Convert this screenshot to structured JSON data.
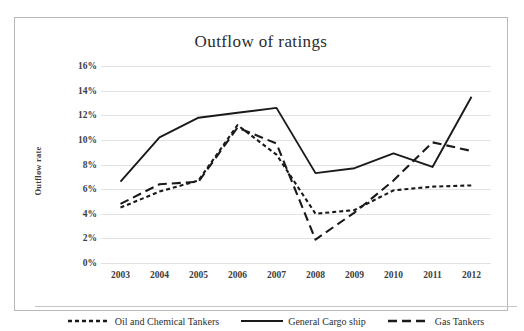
{
  "chart_data": {
    "type": "line",
    "title": "Outflow of ratings",
    "xlabel": "",
    "ylabel": "Outflow rate",
    "x": [
      "2003",
      "2004",
      "2005",
      "2006",
      "2007",
      "2008",
      "2009",
      "2010",
      "2011",
      "2012"
    ],
    "categories": [
      "2003",
      "2004",
      "2005",
      "2006",
      "2007",
      "2008",
      "2009",
      "2010",
      "2011",
      "2012"
    ],
    "ylim": [
      0,
      16
    ],
    "ytick_labels": [
      "0%",
      "2%",
      "4%",
      "6%",
      "8%",
      "10%",
      "12%",
      "14%",
      "16%"
    ],
    "ytick_values": [
      0,
      2,
      4,
      6,
      8,
      10,
      12,
      14,
      16
    ],
    "grid": true,
    "legend_position": "bottom",
    "series": [
      {
        "name": "Oil and Chemical Tankers",
        "style": "dotted",
        "color": "#1a1a1a",
        "values": [
          4.5,
          5.8,
          6.7,
          11.2,
          8.8,
          4.0,
          4.3,
          5.9,
          6.2,
          6.3
        ]
      },
      {
        "name": "General Cargo ship",
        "style": "solid",
        "color": "#1a1a1a",
        "values": [
          6.6,
          10.2,
          11.8,
          12.2,
          12.6,
          7.3,
          7.7,
          8.9,
          7.8,
          13.5
        ]
      },
      {
        "name": "Gas Tankers",
        "style": "dashed",
        "color": "#1a1a1a",
        "values": [
          4.8,
          6.4,
          6.6,
          11.0,
          9.7,
          1.9,
          4.1,
          6.7,
          9.8,
          9.1
        ]
      }
    ]
  }
}
